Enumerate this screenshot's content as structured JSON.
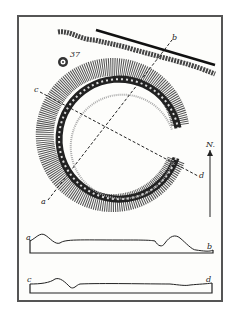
{
  "figure": {
    "labels": {
      "a": "a",
      "b": "b",
      "c": "c",
      "d": "d",
      "number": "37",
      "north": "N."
    },
    "sections": [
      {
        "name": "section-a-b",
        "start": "a",
        "end": "b"
      },
      {
        "name": "section-c-d",
        "start": "c",
        "end": "d"
      }
    ],
    "colors": {
      "ink": "#222222",
      "paper": "#fdfdfb",
      "border": "#555555"
    }
  }
}
